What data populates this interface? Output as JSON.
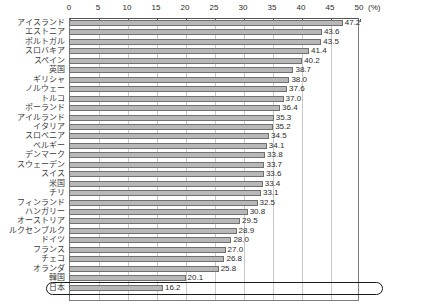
{
  "chart_data": {
    "type": "bar",
    "orientation": "horizontal",
    "title": "",
    "subtitle": "",
    "xlabel": "",
    "ylabel": "",
    "unit_label": "(%)",
    "xlim": [
      0,
      50
    ],
    "xticks": [
      0,
      5,
      10,
      15,
      20,
      25,
      30,
      35,
      40,
      45,
      50
    ],
    "xtick_labels": [
      "0",
      "5",
      "10",
      "15",
      "20",
      "25",
      "30",
      "35",
      "40",
      "45",
      "50"
    ],
    "grid": true,
    "legend": false,
    "highlight_category": "日本",
    "categories": [
      "アイスランド",
      "エストニア",
      "ポルトガル",
      "スロバキア",
      "スペイン",
      "英国",
      "ギリシャ",
      "ノルウェー",
      "トルコ",
      "ポーランド",
      "アイルランド",
      "イタリア",
      "スロベニア",
      "ベルギー",
      "デンマーク",
      "スウェーデン",
      "スイス",
      "米国",
      "チリ",
      "フィンランド",
      "ハンガリー",
      "オーストリア",
      "ルクセンブルク",
      "ドイツ",
      "フランス",
      "チェコ",
      "オランダ",
      "韓国",
      "日本"
    ],
    "values": [
      47.2,
      43.6,
      43.5,
      41.4,
      40.2,
      38.7,
      38.0,
      37.6,
      37.0,
      36.4,
      35.3,
      35.2,
      34.5,
      34.1,
      33.8,
      33.7,
      33.6,
      33.4,
      33.1,
      32.5,
      30.8,
      29.5,
      28.9,
      28.0,
      27.0,
      26.8,
      25.8,
      20.1,
      16.2
    ],
    "value_labels": [
      "47.2",
      "43.6",
      "43.5",
      "41.4",
      "40.2",
      "38.7",
      "38.0",
      "37.6",
      "37.0",
      "36.4",
      "35.3",
      "35.2",
      "34.5",
      "34.1",
      "33.8",
      "33.7",
      "33.6",
      "33.4",
      "33.1",
      "32.5",
      "30.8",
      "29.5",
      "28.9",
      "28.0",
      "27.0",
      "26.8",
      "25.8",
      "20.1",
      "16.2"
    ],
    "colors": {
      "bar_fill": "#b8b8b8",
      "bar_border": "#6f6f6f",
      "gridline": "#c9c9c9",
      "frame": "#7d7d7d",
      "text": "#2b2b2b",
      "highlight_outline": "#1a1a1a"
    }
  }
}
